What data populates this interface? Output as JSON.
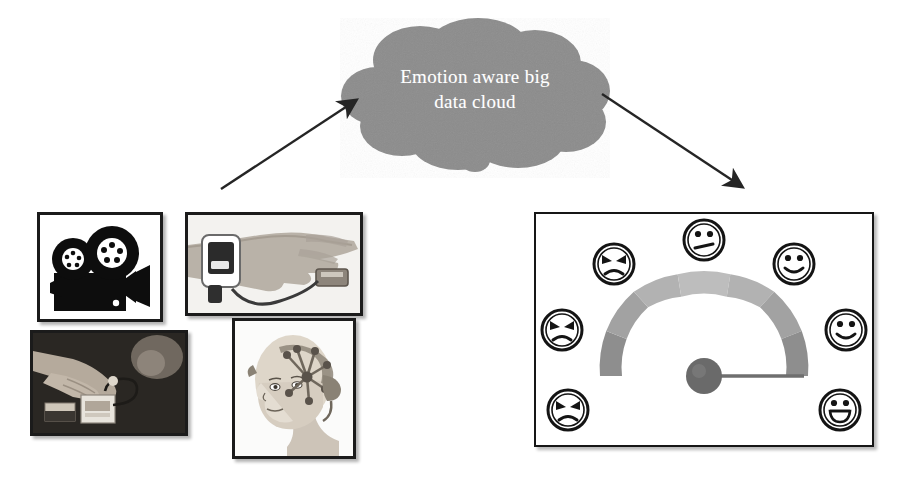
{
  "figure": {
    "background_color": "#ffffff"
  },
  "cloud": {
    "name": "emotion-aware-big-data-cloud",
    "line1": "Emotion aware big",
    "line2": "data cloud",
    "text_full": "Emotion aware big data cloud",
    "fill_color": "#8c8c8c",
    "text_color": "#ffffff"
  },
  "arrows": [
    {
      "name": "arrow-sensors-to-cloud",
      "direction": "up-right",
      "from": "sensor-input-panels",
      "to": "emotion-aware-big-data-cloud",
      "color": "#252525"
    },
    {
      "name": "arrow-cloud-to-gauge",
      "direction": "down-right",
      "from": "emotion-aware-big-data-cloud",
      "to": "emotion-gauge-panel",
      "color": "#252525"
    }
  ],
  "input_panels": [
    {
      "name": "panel-video-camera",
      "icon": "film-camera-icon",
      "caption": "film camera with twin reels",
      "style": "black-and-white silhouette"
    },
    {
      "name": "panel-wrist-biosensor",
      "icon": "wrist-wearable-sensor-icon",
      "caption": "hand wearing wrist sensor with finger clip",
      "style": "grayscale photograph"
    },
    {
      "name": "panel-handheld-sensor",
      "icon": "handheld-sensor-device-icon",
      "caption": "hands operating a small sensor module",
      "style": "grayscale photograph"
    },
    {
      "name": "panel-eeg-headset",
      "icon": "eeg-headset-icon",
      "caption": "person wearing EEG electrode headset",
      "style": "grayscale illustration"
    }
  ],
  "gauge": {
    "name": "emotion-gauge-panel",
    "type": "semicircular-gauge",
    "segment_count": 7,
    "needle_angle_deg": 0,
    "needle_position": "rightmost",
    "needle_color": "#6f6f6f",
    "hub_color": "#6a6a6a",
    "arc_colors": [
      "#8e8e8e",
      "#a3a3a3",
      "#b4b4b4",
      "#bcbcbc",
      "#b4b4b4",
      "#a3a3a3",
      "#8e8e8e"
    ],
    "faces": [
      {
        "name": "face-angry-strong",
        "expression": "angry",
        "position": "lower-left"
      },
      {
        "name": "face-angry-medium",
        "expression": "angry",
        "position": "mid-left"
      },
      {
        "name": "face-angry-mild",
        "expression": "angry",
        "position": "upper-left"
      },
      {
        "name": "face-neutral",
        "expression": "neutral",
        "position": "top"
      },
      {
        "name": "face-happy-mild",
        "expression": "smiling",
        "position": "upper-right"
      },
      {
        "name": "face-happy-medium",
        "expression": "smiling",
        "position": "mid-right"
      },
      {
        "name": "face-happy-strong",
        "expression": "grinning",
        "position": "lower-right"
      }
    ]
  }
}
